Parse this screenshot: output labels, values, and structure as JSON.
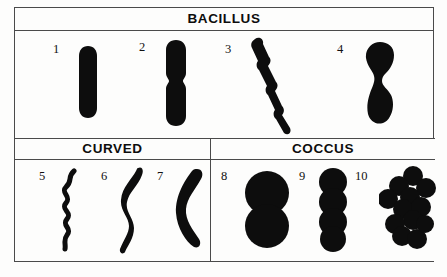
{
  "figure": {
    "title_visible": false,
    "background_color": "#fdfdfc",
    "ink_color": "#0d0d0d",
    "border_color": "#4a4a4a"
  },
  "sections": [
    {
      "id": "bacillus",
      "label": "BACILLUS"
    },
    {
      "id": "curved",
      "label": "CURVED"
    },
    {
      "id": "coccus",
      "label": "COCCUS"
    }
  ],
  "specimens": [
    {
      "number": "1",
      "section": "bacillus",
      "shape": "single-rod"
    },
    {
      "number": "2",
      "section": "bacillus",
      "shape": "paired-rod-with-constriction"
    },
    {
      "number": "3",
      "section": "bacillus",
      "shape": "diagonal-rod-chain"
    },
    {
      "number": "4",
      "section": "bacillus",
      "shape": "dividing-rod-dumbbell"
    },
    {
      "number": "5",
      "section": "curved",
      "shape": "tight-spiral-spirochete"
    },
    {
      "number": "6",
      "section": "curved",
      "shape": "wavy-spirillum"
    },
    {
      "number": "7",
      "section": "curved",
      "shape": "thick-comma-vibrio"
    },
    {
      "number": "8",
      "section": "coccus",
      "shape": "diplococcus-two-spheres"
    },
    {
      "number": "9",
      "section": "coccus",
      "shape": "streptococcus-chain-of-four"
    },
    {
      "number": "10",
      "section": "coccus",
      "shape": "staphylococcus-cluster"
    }
  ]
}
